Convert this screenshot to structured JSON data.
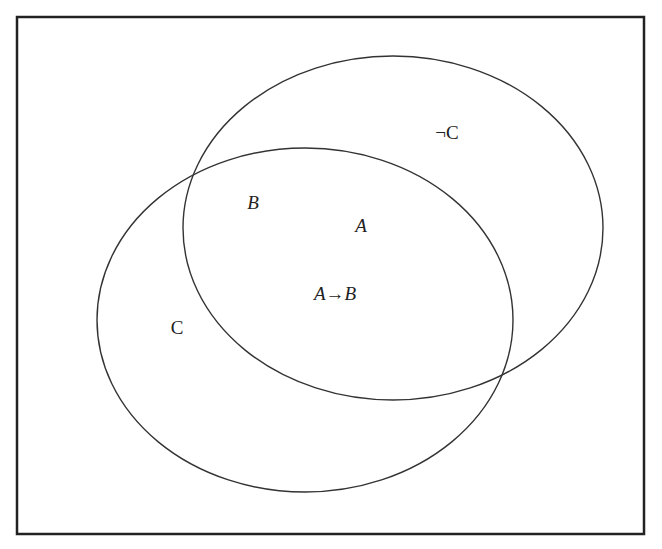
{
  "diagram": {
    "type": "venn",
    "frame": {
      "x": 17,
      "y": 17,
      "width": 627,
      "height": 517,
      "stroke": "#222222"
    },
    "ellipses": [
      {
        "name": "right-ellipse",
        "cx": 393,
        "cy": 228,
        "rx": 210,
        "ry": 172,
        "stroke": "#333333"
      },
      {
        "name": "left-ellipse",
        "cx": 305,
        "cy": 320,
        "rx": 208,
        "ry": 172,
        "stroke": "#333333"
      }
    ],
    "labels": [
      {
        "id": "not_c",
        "text": "¬C",
        "x": 447,
        "y": 132,
        "italic": false
      },
      {
        "id": "b",
        "text": "B",
        "x": 253,
        "y": 202,
        "italic": true
      },
      {
        "id": "a",
        "text": "A",
        "x": 361,
        "y": 225,
        "italic": true
      },
      {
        "id": "a_implies_b",
        "text": "A→B",
        "x": 335,
        "y": 293,
        "italic": true
      },
      {
        "id": "c",
        "text": "C",
        "x": 177,
        "y": 327,
        "italic": false
      }
    ]
  }
}
